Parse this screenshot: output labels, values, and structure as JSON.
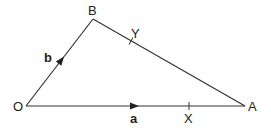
{
  "diagram": {
    "type": "vector-triangle",
    "points": {
      "O": {
        "label": "O",
        "x": 26,
        "y": 106
      },
      "A": {
        "label": "A",
        "x": 245,
        "y": 106
      },
      "B": {
        "label": "B",
        "x": 93,
        "y": 19
      },
      "X": {
        "label": "X",
        "x": 189,
        "y": 106
      },
      "Y": {
        "label": "Y",
        "x": 131,
        "y": 41
      }
    },
    "vectors": {
      "a": {
        "label": "a",
        "from": "O",
        "to": "A"
      },
      "b": {
        "label": "b",
        "from": "O",
        "to": "B"
      }
    },
    "segments": [
      {
        "from": "O",
        "to": "A",
        "arrow": true
      },
      {
        "from": "O",
        "to": "B",
        "arrow": true
      },
      {
        "from": "B",
        "to": "A",
        "arrow": false
      }
    ],
    "line_color": "#333333"
  }
}
